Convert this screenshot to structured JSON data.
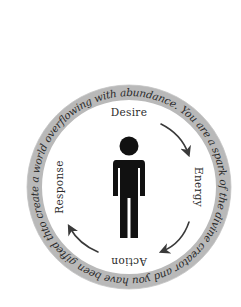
{
  "diagram": {
    "title": "",
    "center": {
      "x": 129,
      "y": 187
    },
    "ring": {
      "outer_radius": 102,
      "inner_radius": 87,
      "fill_color": "#b9b9b9",
      "text": "to create a world overflowing with abundance. You are a spark of the divine creator and you have been gifted the ability to create a world overflowing"
    },
    "center_icon": "person-icon",
    "cycle": [
      {
        "label": "Desire",
        "position": "top"
      },
      {
        "label": "Energy",
        "position": "right"
      },
      {
        "label": "Action",
        "position": "bottom"
      },
      {
        "label": "Response",
        "position": "left"
      }
    ],
    "arrows": [
      {
        "from": "Desire",
        "to": "Energy",
        "direction": "clockwise"
      },
      {
        "from": "Energy",
        "to": "Action",
        "direction": "clockwise"
      },
      {
        "from": "Action",
        "to": "Response",
        "direction": "clockwise"
      }
    ],
    "colors": {
      "icon": "#111111",
      "arrow": "#3a3a3a",
      "text": "#2b2b2b",
      "ring": "#b9b9b9",
      "background": "#ffffff"
    }
  }
}
